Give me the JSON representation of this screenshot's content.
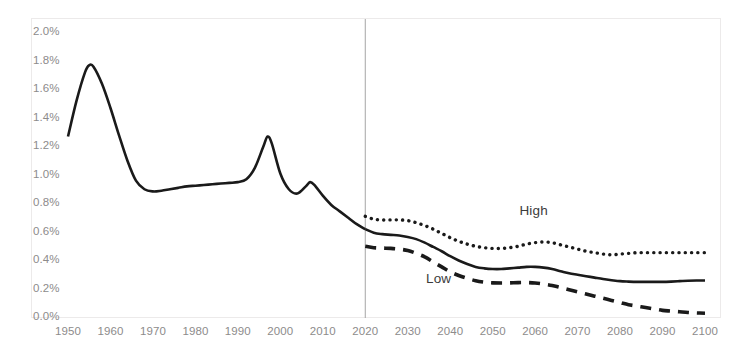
{
  "chart_data": {
    "type": "line",
    "title": "",
    "subtitle": "",
    "xlabel": "",
    "ylabel": "",
    "xlim": [
      1950,
      2100
    ],
    "ylim": [
      0.0,
      2.0
    ],
    "y_unit": "%",
    "grid": false,
    "legend_position": "inline-annotations",
    "y_ticks": [
      "0.0%",
      "0.2%",
      "0.4%",
      "0.6%",
      "0.8%",
      "1.0%",
      "1.2%",
      "1.4%",
      "1.6%",
      "1.8%",
      "2.0%"
    ],
    "y_tick_values": [
      0.0,
      0.2,
      0.4,
      0.6,
      0.8,
      1.0,
      1.2,
      1.4,
      1.6,
      1.8,
      2.0
    ],
    "x_ticks": [
      "1950",
      "1960",
      "1970",
      "1980",
      "1990",
      "2000",
      "2010",
      "2020",
      "2030",
      "2040",
      "2050",
      "2060",
      "2070",
      "2080",
      "2090",
      "2100"
    ],
    "x_tick_values": [
      1950,
      1960,
      1970,
      1980,
      1990,
      2000,
      2010,
      2020,
      2030,
      2040,
      2050,
      2060,
      2070,
      2080,
      2090,
      2100
    ],
    "annotations": [
      {
        "text": "High",
        "x": 2061,
        "y": 0.74
      },
      {
        "text": "Low",
        "x": 2039,
        "y": 0.26
      }
    ],
    "reference_lines": [
      {
        "orientation": "vertical",
        "x": 2020,
        "label": "",
        "color": "#a6a6a6"
      }
    ],
    "series": [
      {
        "name": "Historical",
        "style": "solid",
        "color": "#1a1a1a",
        "x": [
          1950,
          1952,
          1954,
          1955,
          1956,
          1958,
          1960,
          1962,
          1964,
          1966,
          1968,
          1970,
          1972,
          1974,
          1976,
          1978,
          1980,
          1982,
          1984,
          1986,
          1988,
          1990,
          1992,
          1994,
          1996,
          1997,
          1998,
          2000,
          2002,
          2004,
          2006,
          2007,
          2008,
          2010,
          2012,
          2014,
          2016,
          2018,
          2020
        ],
        "values": [
          1.27,
          1.52,
          1.72,
          1.77,
          1.76,
          1.64,
          1.47,
          1.28,
          1.1,
          0.96,
          0.9,
          0.885,
          0.89,
          0.9,
          0.91,
          0.92,
          0.925,
          0.93,
          0.935,
          0.94,
          0.945,
          0.95,
          0.97,
          1.05,
          1.2,
          1.27,
          1.22,
          1.01,
          0.9,
          0.87,
          0.92,
          0.95,
          0.93,
          0.855,
          0.79,
          0.745,
          0.7,
          0.655,
          0.62
        ]
      },
      {
        "name": "High",
        "style": "dotted",
        "color": "#1a1a1a",
        "x": [
          2020,
          2022,
          2024,
          2026,
          2028,
          2030,
          2032,
          2034,
          2036,
          2038,
          2040,
          2042,
          2044,
          2046,
          2048,
          2050,
          2052,
          2054,
          2056,
          2058,
          2060,
          2062,
          2064,
          2066,
          2068,
          2070,
          2072,
          2074,
          2076,
          2078,
          2080,
          2082,
          2084,
          2086,
          2088,
          2090,
          2092,
          2094,
          2096,
          2098,
          2100
        ],
        "values": [
          0.71,
          0.69,
          0.685,
          0.685,
          0.685,
          0.68,
          0.665,
          0.645,
          0.62,
          0.59,
          0.56,
          0.535,
          0.515,
          0.5,
          0.49,
          0.485,
          0.485,
          0.49,
          0.5,
          0.515,
          0.525,
          0.53,
          0.525,
          0.51,
          0.495,
          0.48,
          0.465,
          0.455,
          0.445,
          0.44,
          0.445,
          0.45,
          0.455,
          0.455,
          0.455,
          0.455,
          0.455,
          0.455,
          0.455,
          0.455,
          0.455
        ]
      },
      {
        "name": "Medium",
        "style": "solid",
        "color": "#1a1a1a",
        "x": [
          2020,
          2022,
          2024,
          2026,
          2028,
          2030,
          2032,
          2034,
          2036,
          2038,
          2040,
          2042,
          2044,
          2046,
          2048,
          2050,
          2052,
          2054,
          2056,
          2058,
          2060,
          2062,
          2064,
          2066,
          2068,
          2070,
          2072,
          2074,
          2076,
          2078,
          2080,
          2082,
          2084,
          2086,
          2088,
          2090,
          2092,
          2094,
          2096,
          2098,
          2100
        ],
        "values": [
          0.62,
          0.595,
          0.585,
          0.58,
          0.575,
          0.565,
          0.55,
          0.525,
          0.495,
          0.465,
          0.43,
          0.4,
          0.375,
          0.355,
          0.345,
          0.34,
          0.34,
          0.345,
          0.35,
          0.355,
          0.355,
          0.35,
          0.34,
          0.325,
          0.31,
          0.3,
          0.29,
          0.28,
          0.27,
          0.262,
          0.255,
          0.252,
          0.25,
          0.25,
          0.25,
          0.25,
          0.252,
          0.255,
          0.258,
          0.26,
          0.26
        ]
      },
      {
        "name": "Low",
        "style": "dashed",
        "color": "#1a1a1a",
        "x": [
          2020,
          2022,
          2024,
          2026,
          2028,
          2030,
          2032,
          2034,
          2036,
          2038,
          2040,
          2042,
          2044,
          2046,
          2048,
          2050,
          2052,
          2054,
          2056,
          2058,
          2060,
          2062,
          2064,
          2066,
          2068,
          2070,
          2072,
          2074,
          2076,
          2078,
          2080,
          2082,
          2084,
          2086,
          2088,
          2090,
          2092,
          2094,
          2096,
          2098,
          2100
        ],
        "values": [
          0.5,
          0.49,
          0.487,
          0.485,
          0.48,
          0.47,
          0.45,
          0.425,
          0.39,
          0.355,
          0.32,
          0.295,
          0.275,
          0.258,
          0.248,
          0.243,
          0.242,
          0.243,
          0.245,
          0.245,
          0.242,
          0.235,
          0.225,
          0.21,
          0.195,
          0.18,
          0.165,
          0.15,
          0.135,
          0.12,
          0.105,
          0.09,
          0.08,
          0.07,
          0.06,
          0.05,
          0.045,
          0.04,
          0.035,
          0.032,
          0.03
        ]
      }
    ]
  },
  "axes": {
    "y_label_color": "#8d8b8b",
    "x_label_color": "#8d8b8b"
  }
}
